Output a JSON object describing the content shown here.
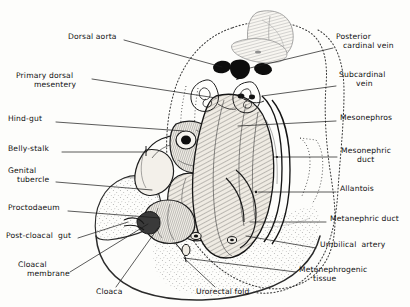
{
  "figure": {
    "type": "anatomical-line-drawing",
    "style": "hand-drawn pen-and-ink stipple and hatch illustration",
    "orientation": "sagittal section, head upper-left, tail lower-right"
  },
  "palette": {
    "background": "#fdfdfb",
    "ink": "#151515",
    "leader_line": "#1a1a1a",
    "dotted_outline": "#3a3a3a",
    "fill_light": "#f2efe9",
    "fill_mid": "#e2ddd4",
    "vessel_dark": "#121212"
  },
  "labels_left": [
    {
      "id": "dorsal-aorta",
      "text": "Dorsal aorta",
      "x": 68,
      "y": 36,
      "align": "left"
    },
    {
      "id": "primary-dorsal-mesentery",
      "line1": "Primary dorsal",
      "line2": "mesentery",
      "x": 16,
      "y": 75,
      "align": "left"
    },
    {
      "id": "hind-gut",
      "text": "Hind-gut",
      "x": 8,
      "y": 118,
      "align": "left"
    },
    {
      "id": "belly-stalk",
      "text": "Belly-stalk",
      "x": 8,
      "y": 148,
      "align": "left"
    },
    {
      "id": "genital-tubercle",
      "line1": "Genital",
      "line2": "tubercle",
      "x": 8,
      "y": 170,
      "align": "left"
    },
    {
      "id": "proctodaeum",
      "text": "Proctodaeum",
      "x": 8,
      "y": 207,
      "align": "left"
    },
    {
      "id": "post-cloacal-gut",
      "text": "Post-cloacal  gut",
      "x": 6,
      "y": 235,
      "align": "left"
    },
    {
      "id": "cloacal-membrane",
      "line1": "Cloacal",
      "line2": "membrane",
      "x": 18,
      "y": 264,
      "align": "left"
    }
  ],
  "labels_right": [
    {
      "id": "posterior-cardinal-vein",
      "line1": "Posterior",
      "line2": "cardinal vein",
      "x": 336,
      "y": 36,
      "align": "left"
    },
    {
      "id": "subcardinal-vein",
      "line1": "Subcardinal",
      "line2": "vein",
      "x": 339,
      "y": 74,
      "align": "left"
    },
    {
      "id": "mesonephros",
      "text": "Mesonephros",
      "x": 340,
      "y": 117,
      "align": "left"
    },
    {
      "id": "mesonephric-duct",
      "line1": "Mesonephric",
      "line2": "duct",
      "x": 341,
      "y": 150,
      "align": "left"
    },
    {
      "id": "allantois",
      "text": "Allantois",
      "x": 340,
      "y": 188,
      "align": "left"
    },
    {
      "id": "metanephric-duct",
      "text": "Metanephric duct",
      "x": 330,
      "y": 218,
      "align": "left"
    },
    {
      "id": "umbilical-artery",
      "text": "Umbilical  artery",
      "x": 320,
      "y": 244,
      "align": "left"
    },
    {
      "id": "metanephrogenic-tissue",
      "line1": "Metanephrogenic",
      "line2": "tissue",
      "x": 299,
      "y": 269,
      "align": "left"
    }
  ],
  "labels_bottom": [
    {
      "id": "cloaca",
      "text": "Cloaca",
      "x": 96,
      "y": 291,
      "align": "left"
    },
    {
      "id": "urorectal-fold",
      "text": "Urorectal fold",
      "x": 196,
      "y": 291,
      "align": "left"
    }
  ],
  "leader_lines": [
    {
      "from": "dorsal-aorta",
      "x1": 124,
      "y1": 40,
      "x2": 222,
      "y2": 67
    },
    {
      "from": "primary-dorsal-mesentery",
      "x1": 92,
      "y1": 79,
      "x2": 216,
      "y2": 98
    },
    {
      "from": "hind-gut",
      "x1": 56,
      "y1": 122,
      "x2": 184,
      "y2": 131
    },
    {
      "from": "belly-stalk",
      "x1": 62,
      "y1": 152,
      "x2": 146,
      "y2": 152
    },
    {
      "from": "genital-tubercle",
      "x1": 56,
      "y1": 182,
      "x2": 152,
      "y2": 190
    },
    {
      "from": "proctodaeum",
      "x1": 68,
      "y1": 211,
      "x2": 160,
      "y2": 218
    },
    {
      "from": "post-cloacal-gut",
      "x1": 78,
      "y1": 238,
      "x2": 128,
      "y2": 222
    },
    {
      "from": "cloacal-membrane",
      "x1": 70,
      "y1": 272,
      "x2": 148,
      "y2": 224
    },
    {
      "from": "cloaca",
      "x1": 116,
      "y1": 287,
      "x2": 158,
      "y2": 228
    },
    {
      "from": "urorectal-fold",
      "x1": 215,
      "y1": 287,
      "x2": 184,
      "y2": 258
    },
    {
      "from": "posterior-cardinal-vein",
      "x1": 333,
      "y1": 48,
      "x2": 250,
      "y2": 68
    },
    {
      "from": "subcardinal-vein",
      "x1": 336,
      "y1": 86,
      "x2": 262,
      "y2": 96
    },
    {
      "from": "mesonephros",
      "x1": 336,
      "y1": 121,
      "x2": 238,
      "y2": 126
    },
    {
      "from": "mesonephric-duct",
      "x1": 337,
      "y1": 157,
      "x2": 274,
      "y2": 157
    },
    {
      "from": "allantois",
      "x1": 336,
      "y1": 192,
      "x2": 258,
      "y2": 192
    },
    {
      "from": "metanephric-duct",
      "x1": 326,
      "y1": 222,
      "x2": 250,
      "y2": 222
    },
    {
      "from": "umbilical-artery",
      "x1": 316,
      "y1": 248,
      "x2": 246,
      "y2": 236
    },
    {
      "from": "metanephrogenic-tissue",
      "x1": 296,
      "y1": 272,
      "x2": 184,
      "y2": 258
    }
  ],
  "structures": [
    {
      "id": "neural-tube",
      "note": "faint hatched oval, upper centre"
    },
    {
      "id": "notochord-somite",
      "note": "faint hatched band below neural tube"
    },
    {
      "id": "dorsal-aorta-lumen",
      "note": "dark central blob"
    },
    {
      "id": "cardinal-veins",
      "note": "two dark lateral blobs"
    },
    {
      "id": "mesonephric-tubules",
      "note": "coiled convoluted loops beneath vessels"
    },
    {
      "id": "hind-gut-tube",
      "note": "cut tube with dark lumen, mid-left"
    },
    {
      "id": "mesonephros-body",
      "note": "large hatched elongated mass, right"
    },
    {
      "id": "cloaca-chamber",
      "note": "lower junction chamber"
    },
    {
      "id": "metanephrogenic-stipple",
      "note": "stippled tail region, lower right"
    },
    {
      "id": "body-outline",
      "note": "dotted embryo contour"
    }
  ]
}
